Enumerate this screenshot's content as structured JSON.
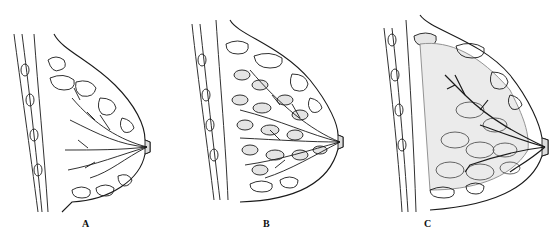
{
  "figure": {
    "panels": [
      {
        "id": "A",
        "label": "A",
        "x": 0,
        "label_x": 82,
        "label_y": 226,
        "fill": "#ffffff",
        "ducts": "fine"
      },
      {
        "id": "B",
        "label": "B",
        "x": 180,
        "label_x": 263,
        "label_y": 226,
        "fill": "#eeeeee",
        "ducts": "dense"
      },
      {
        "id": "C",
        "label": "C",
        "x": 370,
        "label_x": 424,
        "label_y": 226,
        "fill": "#e6e6e6",
        "ducts": "sparse"
      }
    ],
    "colors": {
      "ink": "#1a1a1a",
      "gland_fill": "#e8e8e8",
      "background": "#ffffff"
    }
  }
}
